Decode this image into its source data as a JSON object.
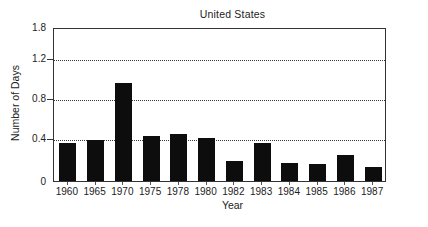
{
  "chart_data": {
    "type": "bar",
    "title": "United States",
    "xlabel": "Year",
    "ylabel": "Number of Days",
    "categories": [
      "1960",
      "1965",
      "1970",
      "1975",
      "1978",
      "1980",
      "1982",
      "1983",
      "1984",
      "1985",
      "1986",
      "1987"
    ],
    "values": [
      0.35,
      0.38,
      0.95,
      0.42,
      0.44,
      0.4,
      0.19,
      0.35,
      0.17,
      0.16,
      0.24,
      0.13
    ],
    "series": [
      {
        "name": "Number of Days",
        "values": [
          0.35,
          0.38,
          0.95,
          0.42,
          0.44,
          0.4,
          0.19,
          0.35,
          0.17,
          0.16,
          0.24,
          0.13
        ]
      }
    ],
    "ylim": [
      0,
      1.8
    ],
    "ytick_labels": [
      "1.8",
      "1.2",
      "0.8",
      "0.4",
      "0"
    ],
    "ytick_values": [
      1.8,
      1.2,
      0.8,
      0.4,
      0
    ],
    "gridlines": [
      "1.2",
      "0.8",
      "0.4"
    ],
    "grid": true,
    "legend": null,
    "bar_color": "#0d0d0d",
    "axis_color": "#333333",
    "background": "#ffffff"
  },
  "figure": {
    "caption_fragment": ""
  }
}
